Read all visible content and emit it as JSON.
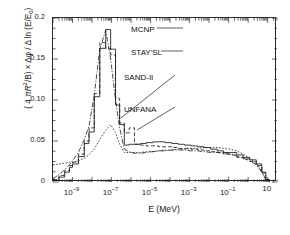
{
  "chart_data": {
    "type": "line",
    "title": "",
    "xlabel": "E (MeV)",
    "ylabel": "( 4 πR²/B) × Δφ / Δ ln (E/E₀)",
    "xscale": "log",
    "yscale": "linear",
    "xlim": [
      1e-10,
      30
    ],
    "ylim": [
      0,
      0.2
    ],
    "grid": false,
    "legend_position": "inline-annotations",
    "x_tick_labels": [
      "10−9",
      "10−7",
      "10−5",
      "10−3",
      "10−1",
      "10"
    ],
    "x_tick_values": [
      1e-09,
      1e-07,
      1e-05,
      0.001,
      0.1,
      10
    ],
    "y_tick_labels": [
      "0",
      "0.05",
      "0.10",
      "0.15",
      "0.2"
    ],
    "y_tick_values": [
      0,
      0.05,
      0.1,
      0.15,
      0.2
    ],
    "annotations": [
      {
        "label": "MCNP",
        "x": 131,
        "y": 25
      },
      {
        "label": "STAY'SL",
        "x": 131,
        "y": 48
      },
      {
        "label": "SAND-II",
        "x": 124,
        "y": 73
      },
      {
        "label": "UNFANA",
        "x": 124,
        "y": 105
      }
    ],
    "series": [
      {
        "name": "MCNP",
        "style": "solid-step",
        "x": [
          1e-10,
          2e-10,
          4e-10,
          7e-10,
          1e-09,
          2e-09,
          4e-09,
          7e-09,
          1.3e-08,
          2.5e-08,
          5e-08,
          9e-08,
          1.6e-07,
          2.6e-07,
          4.5e-07,
          8e-07,
          1.5e-06,
          3e-06,
          6e-06,
          1.3e-05,
          2.6e-05,
          5.5e-05,
          0.00012,
          0.00026,
          0.00055,
          0.0012,
          0.0026,
          0.0055,
          0.012,
          0.026,
          0.055,
          0.12,
          0.26,
          0.55,
          1.2,
          2.6,
          5.0,
          8.0,
          12.0
        ],
        "y": [
          0.002,
          0.006,
          0.012,
          0.018,
          0.022,
          0.031,
          0.047,
          0.061,
          0.104,
          0.163,
          0.186,
          0.162,
          0.094,
          0.07,
          0.045,
          0.046,
          0.046,
          0.047,
          0.048,
          0.049,
          0.049,
          0.048,
          0.047,
          0.046,
          0.045,
          0.044,
          0.043,
          0.042,
          0.04,
          0.038,
          0.036,
          0.036,
          0.033,
          0.03,
          0.027,
          0.022,
          0.012,
          0.003,
          0.0
        ]
      },
      {
        "name": "STAY'SL",
        "style": "dashed-step",
        "x": [
          1e-10,
          2e-10,
          4e-10,
          7e-10,
          1e-09,
          2e-09,
          4e-09,
          7e-09,
          1.3e-08,
          2.5e-08,
          5e-08,
          9e-08,
          1.6e-07,
          2.6e-07,
          4.5e-07,
          8e-07,
          1.5e-06,
          3e-06,
          6e-06,
          1.3e-05,
          2.6e-05,
          5.5e-05,
          0.00012,
          0.00026,
          0.00055,
          0.0012,
          0.0026,
          0.0055,
          0.012,
          0.026,
          0.055,
          0.12,
          0.26,
          0.55,
          1.2,
          2.6,
          5.0,
          8.0,
          12.0
        ],
        "y": [
          0.003,
          0.008,
          0.014,
          0.02,
          0.024,
          0.034,
          0.05,
          0.066,
          0.108,
          0.17,
          0.163,
          0.155,
          0.102,
          0.072,
          0.06,
          0.066,
          0.046,
          0.045,
          0.044,
          0.044,
          0.043,
          0.043,
          0.042,
          0.041,
          0.041,
          0.04,
          0.039,
          0.038,
          0.037,
          0.036,
          0.034,
          0.033,
          0.03,
          0.028,
          0.025,
          0.02,
          0.011,
          0.003,
          0.0
        ]
      },
      {
        "name": "SAND-II",
        "style": "dashdot",
        "x": [
          1e-10,
          2e-10,
          4e-10,
          7e-10,
          1e-09,
          2e-09,
          4e-09,
          7e-09,
          1.3e-08,
          2.5e-08,
          5e-08,
          9e-08,
          1.6e-07,
          2.6e-07,
          4.5e-07,
          8e-07,
          1.5e-06,
          3e-06,
          6e-06,
          1.3e-05,
          2.6e-05,
          5.5e-05,
          0.00012,
          0.00026,
          0.00055,
          0.0012,
          0.0026,
          0.0055,
          0.012,
          0.026,
          0.055,
          0.12,
          0.26,
          0.55,
          1.2,
          2.6,
          5.0,
          8.0,
          12.0
        ],
        "y": [
          0.004,
          0.009,
          0.015,
          0.021,
          0.026,
          0.036,
          0.052,
          0.068,
          0.106,
          0.162,
          0.185,
          0.15,
          0.1,
          0.066,
          0.04,
          0.037,
          0.035,
          0.035,
          0.036,
          0.037,
          0.038,
          0.038,
          0.039,
          0.039,
          0.039,
          0.038,
          0.038,
          0.037,
          0.036,
          0.036,
          0.035,
          0.034,
          0.032,
          0.029,
          0.026,
          0.021,
          0.012,
          0.003,
          0.0
        ]
      },
      {
        "name": "UNFANA",
        "style": "dotted",
        "x": [
          1e-10,
          2e-10,
          4e-10,
          7e-10,
          1e-09,
          2e-09,
          4e-09,
          7e-09,
          1.3e-08,
          2.5e-08,
          5e-08,
          9e-08,
          1.6e-07,
          2.6e-07,
          4.5e-07,
          8e-07,
          1.5e-06,
          3e-06,
          6e-06,
          1.3e-05,
          2.6e-05,
          5.5e-05,
          0.00012,
          0.00026,
          0.00055,
          0.0012,
          0.0026,
          0.0055,
          0.012,
          0.026,
          0.055,
          0.12,
          0.26,
          0.55,
          1.2,
          2.6,
          5.0,
          8.0,
          12.0
        ],
        "y": [
          0.021,
          0.022,
          0.023,
          0.024,
          0.024,
          0.026,
          0.029,
          0.033,
          0.04,
          0.052,
          0.063,
          0.07,
          0.06,
          0.046,
          0.036,
          0.036,
          0.036,
          0.036,
          0.037,
          0.037,
          0.038,
          0.039,
          0.039,
          0.04,
          0.04,
          0.041,
          0.041,
          0.042,
          0.042,
          0.042,
          0.041,
          0.04,
          0.038,
          0.034,
          0.029,
          0.023,
          0.013,
          0.003,
          0.0
        ]
      }
    ]
  },
  "axes": {
    "y_title_html": "( 4 <i>πR</i><sup>2</sup>/B) × Δφ / Δ ln (E/E<sub>0</sub>)"
  }
}
